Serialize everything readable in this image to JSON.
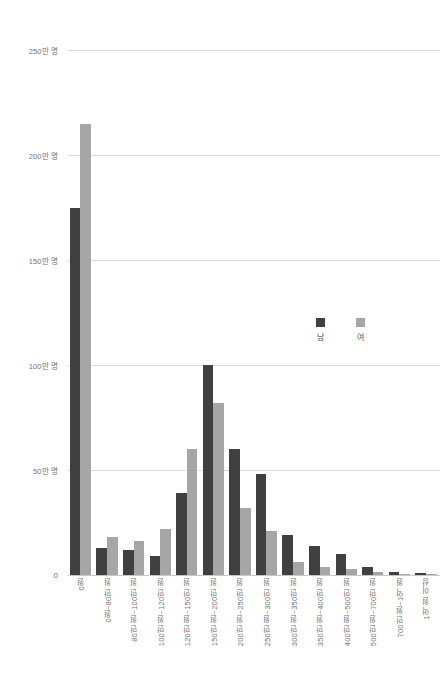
{
  "chart_data": {
    "type": "bar",
    "title": "",
    "subtitle": "",
    "xlabel": "",
    "ylabel": "",
    "ylim": [
      0,
      250
    ],
    "yunit": "만 명",
    "grid": true,
    "legend_position": "right-middle",
    "y_ticks": [
      {
        "value": 250,
        "label": "250만 명"
      },
      {
        "value": 200,
        "label": "200만 명"
      },
      {
        "value": 150,
        "label": "150만 명"
      },
      {
        "value": 100,
        "label": "100만 명"
      },
      {
        "value": 50,
        "label": "50만 명"
      },
      {
        "value": 0,
        "label": "0"
      }
    ],
    "categories": [
      "0원",
      "0원~80만 원",
      "80만 원~100만 원",
      "100만 원~120만 원",
      "120만 원~150만 원",
      "150만 원~200만 원",
      "200만 원~250만 원",
      "250만 원~300만 원",
      "300만 원~350만 원",
      "350만 원~400만 원",
      "400만 원~500만 원",
      "500만 원~700만 원",
      "700만 원~1억 원",
      "1억 원 이상"
    ],
    "series": [
      {
        "name": "남",
        "color": "#404040",
        "values": [
          175,
          13,
          12,
          9,
          39,
          100,
          60,
          48,
          19,
          14,
          10,
          4,
          1.5,
          1
        ]
      },
      {
        "name": "여",
        "color": "#a6a6a6",
        "values": [
          215,
          18,
          16,
          22,
          60,
          82,
          32,
          21,
          6,
          4,
          3,
          1.5,
          0.5,
          0.4
        ]
      }
    ]
  },
  "legend": {
    "items": [
      {
        "label": "남",
        "color": "#404040"
      },
      {
        "label": "여",
        "color": "#a6a6a6"
      }
    ]
  },
  "colors": {
    "male": "#404040",
    "female": "#a6a6a6",
    "gridline": "#d9d9d9",
    "axis_text": "#737373",
    "background": "#ffffff"
  }
}
